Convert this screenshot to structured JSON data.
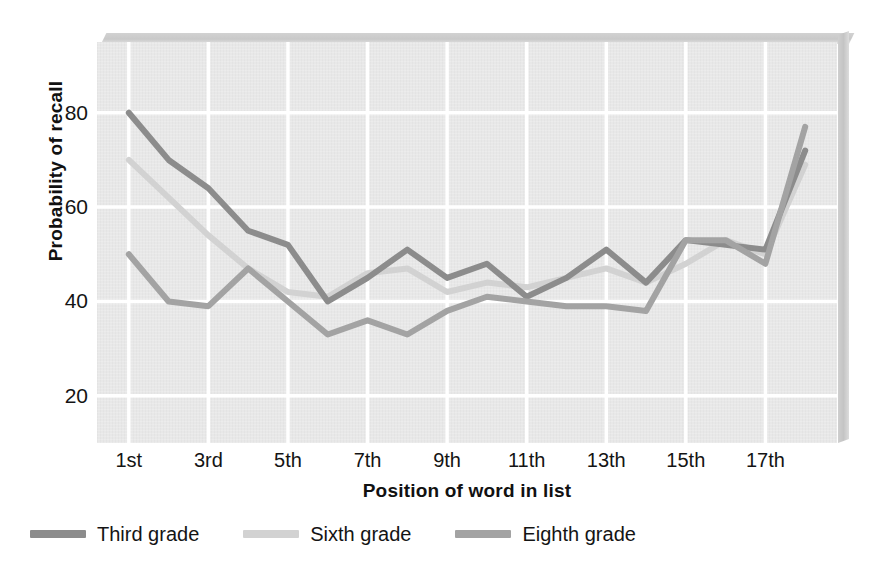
{
  "chart_data": {
    "type": "line",
    "title": "",
    "xlabel": "Position of word in list",
    "ylabel": "Probability of recall",
    "categories": [
      "1st",
      "2nd",
      "3rd",
      "4th",
      "5th",
      "6th",
      "7th",
      "8th",
      "9th",
      "10th",
      "11th",
      "12th",
      "13th",
      "14th",
      "15th",
      "16th",
      "17th",
      "18th"
    ],
    "x_tick_labels": [
      "1st",
      "3rd",
      "5th",
      "7th",
      "9th",
      "11th",
      "13th",
      "15th",
      "17th"
    ],
    "x_tick_positions": [
      1,
      3,
      5,
      7,
      9,
      11,
      13,
      15,
      17
    ],
    "y_tick_labels": [
      "20",
      "40",
      "60",
      "80"
    ],
    "y_ticks": [
      20,
      40,
      60,
      80
    ],
    "ylim": [
      10,
      95
    ],
    "xlim": [
      0.2,
      18.8
    ],
    "grid": true,
    "legend_position": "bottom-left",
    "series": [
      {
        "name": "Third grade",
        "color": "#8c8c8c",
        "values": [
          80,
          70,
          64,
          55,
          52,
          40,
          45,
          51,
          45,
          48,
          41,
          45,
          51,
          44,
          53,
          52,
          51,
          72
        ]
      },
      {
        "name": "Sixth grade",
        "color": "#d2d2d2",
        "values": [
          70,
          62,
          54,
          47,
          42,
          41,
          46,
          47,
          42,
          44,
          43,
          45,
          47,
          44,
          48,
          53,
          50,
          69
        ]
      },
      {
        "name": "Eighth grade",
        "color": "#a3a3a3",
        "values": [
          50,
          40,
          39,
          47,
          40,
          33,
          36,
          33,
          38,
          41,
          40,
          39,
          39,
          38,
          53,
          53,
          48,
          77
        ]
      }
    ]
  },
  "axes": {
    "y_title": "Probability of recall",
    "x_title": "Position of word in list"
  },
  "legend": {
    "items": [
      {
        "label": "Third grade",
        "color": "#8c8c8c"
      },
      {
        "label": "Sixth grade",
        "color": "#d2d2d2"
      },
      {
        "label": "Eighth grade",
        "color": "#a3a3a3"
      }
    ]
  },
  "style": {
    "plot_background": "#e8e8e8",
    "gridline_color": "#ffffff",
    "text_color": "#141414"
  }
}
